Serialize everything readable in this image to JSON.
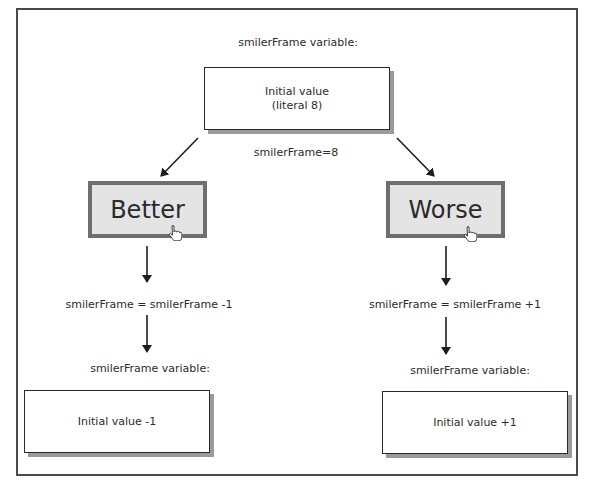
{
  "diagram": {
    "top": {
      "heading": "smilerFrame variable:",
      "box_line1": "Initial value",
      "box_line2": "(literal 8)",
      "assignment": "smilerFrame=8"
    },
    "left": {
      "button_label": "Better",
      "operation": "smilerFrame = smilerFrame -1",
      "heading": "smilerFrame variable:",
      "result": "Initial value -1"
    },
    "right": {
      "button_label": "Worse",
      "operation": "smilerFrame = smilerFrame +1",
      "heading": "smilerFrame variable:",
      "result": "Initial value +1"
    },
    "icons": {
      "cursor": "hand-pointer-icon",
      "arrow": "arrow-down-icon"
    },
    "colors": {
      "frame": "#4a4a4a",
      "button_fill": "#e4e4e4",
      "button_border": "#6e6e6e",
      "shadow": "#9a9a9a"
    }
  }
}
